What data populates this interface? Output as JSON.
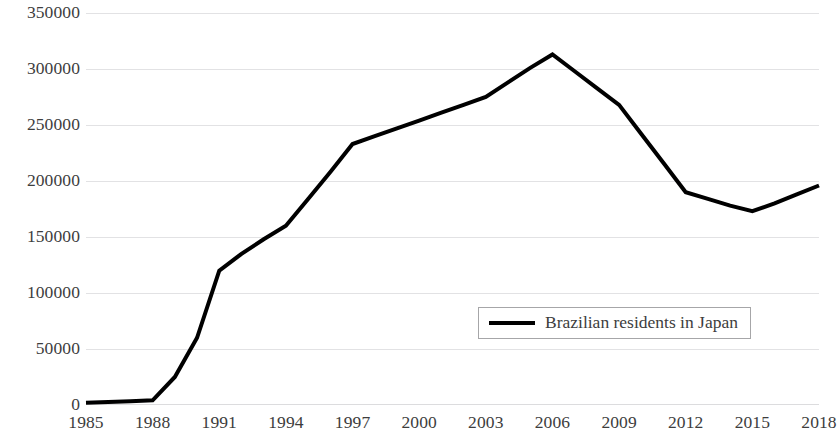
{
  "chart_data": {
    "type": "line",
    "title": "",
    "subtitle": "",
    "xlabel": "",
    "ylabel": "",
    "x": [
      1985,
      1986,
      1987,
      1988,
      1989,
      1990,
      1991,
      1992,
      1993,
      1994,
      1995,
      1996,
      1997,
      1998,
      1999,
      2000,
      2001,
      2002,
      2003,
      2004,
      2005,
      2006,
      2007,
      2008,
      2009,
      2010,
      2011,
      2012,
      2013,
      2014,
      2015,
      2016,
      2017,
      2018
    ],
    "xlim": [
      1985,
      2018
    ],
    "ylim": [
      0,
      350000
    ],
    "grid": true,
    "grid_axis": "y",
    "legend_position": "inside-lower-right",
    "x_tick_labels": [
      "1985",
      "1988",
      "1991",
      "1994",
      "1997",
      "2000",
      "2003",
      "2006",
      "2009",
      "2012",
      "2015",
      "2018"
    ],
    "x_tick_values": [
      1985,
      1988,
      1991,
      1994,
      1997,
      2000,
      2003,
      2006,
      2009,
      2012,
      2015,
      2018
    ],
    "y_tick_labels": [
      "0",
      "50000",
      "100000",
      "150000",
      "200000",
      "250000",
      "300000",
      "350000"
    ],
    "y_tick_values": [
      0,
      50000,
      100000,
      150000,
      200000,
      250000,
      300000,
      350000
    ],
    "series": [
      {
        "name": "Brazilian residents in Japan",
        "color": "#000000",
        "line_width": 4,
        "values": [
          2000,
          2700,
          3400,
          4200,
          25000,
          60000,
          120000,
          135000,
          148000,
          160000,
          184000,
          208000,
          233000,
          240000,
          247000,
          254000,
          261000,
          268000,
          275000,
          288000,
          301000,
          313000,
          298000,
          283000,
          268000,
          242000,
          216000,
          190000,
          184000,
          178000,
          173000,
          180000,
          188000,
          196000
        ]
      }
    ],
    "annotations": []
  },
  "legend": {
    "entries": [
      {
        "label": "Brazilian residents in Japan",
        "color": "#000000"
      }
    ]
  },
  "colors": {
    "series_line": "#000000",
    "gridline": "#e2e2e4",
    "tick_text": "#3d3d3d",
    "legend_border": "#a6a6a8",
    "background": "#ffffff"
  }
}
